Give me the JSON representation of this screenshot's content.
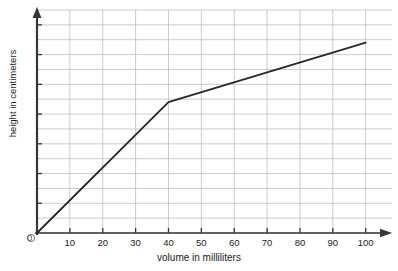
{
  "chart_data": {
    "type": "line",
    "title": "",
    "xlabel": "volume in milliliters",
    "ylabel": "height in centimeters",
    "xlim": [
      0,
      108
    ],
    "ylim": [
      0,
      15
    ],
    "xticks": [
      0,
      10,
      20,
      30,
      40,
      50,
      60,
      70,
      80,
      90,
      100
    ],
    "xtick_labels": [
      "0",
      "10",
      "20",
      "30",
      "40",
      "50",
      "60",
      "70",
      "80",
      "90",
      "100"
    ],
    "yticks": [
      0,
      2,
      4,
      6,
      8,
      10,
      12,
      14
    ],
    "ytick_labels": [
      "0",
      "2",
      "4",
      "6",
      "8",
      "10",
      "12",
      "14"
    ],
    "grid": true,
    "grid_x_step": 10,
    "grid_y_step": 1,
    "legend": "none",
    "series": [
      {
        "name": "height vs volume",
        "color": "#2b2725",
        "x": [
          0,
          40,
          100
        ],
        "y": [
          0,
          8.8,
          12.8
        ]
      }
    ],
    "annotations": {
      "origin_label": "0",
      "x_axis_arrow": true,
      "y_axis_arrow": true
    },
    "colors": {
      "axis": "#3a3533",
      "grid": "#b9b5b2",
      "line": "#2b2725",
      "text": "#201d1c",
      "background": "#ffffff"
    }
  }
}
